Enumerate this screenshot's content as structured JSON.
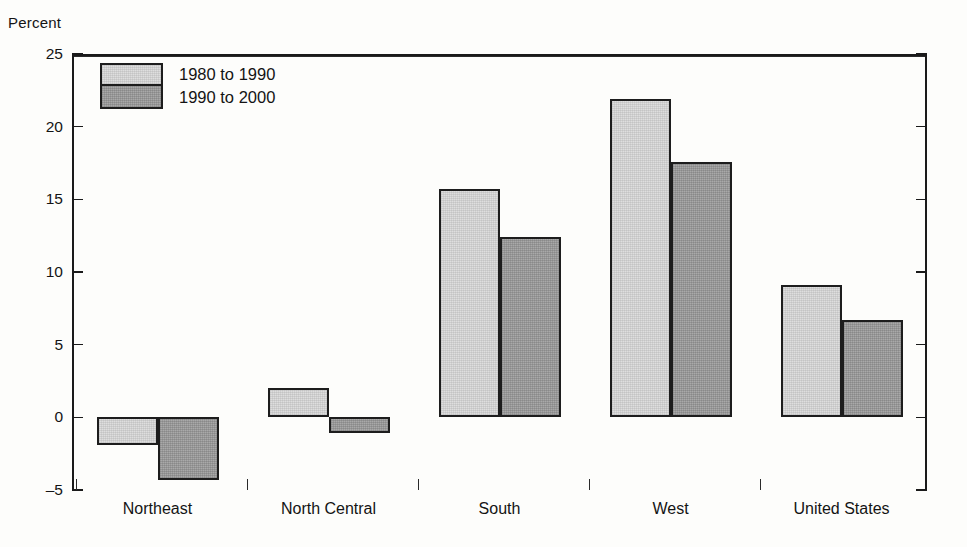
{
  "chart_data": {
    "type": "bar",
    "title": "",
    "ylabel": "Percent",
    "xlabel": "",
    "categories": [
      "Northeast",
      "North Central",
      "South",
      "West",
      "United States"
    ],
    "series": [
      {
        "name": "1980 to 1990",
        "color": "#dedede",
        "values": [
          -1.9,
          2.0,
          15.7,
          21.9,
          9.1
        ]
      },
      {
        "name": "1990 to 2000",
        "color": "#a9a9a9",
        "values": [
          -4.3,
          -1.1,
          12.4,
          17.6,
          6.7
        ]
      }
    ],
    "ylim": [
      -5,
      25
    ],
    "yticks": [
      25,
      20,
      15,
      10,
      5,
      0,
      -5
    ],
    "ytick_labels": [
      "25",
      "20",
      "15",
      "10",
      "5",
      "0",
      "–5"
    ],
    "grid": false,
    "legend_position": "top-left",
    "zero_line": 0,
    "axis_color": "#1a1a1a",
    "background": "#fdfdfb"
  },
  "legend": {
    "items": [
      {
        "label": "1980 to 1990"
      },
      {
        "label": "1990 to 2000"
      }
    ]
  }
}
